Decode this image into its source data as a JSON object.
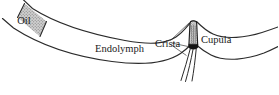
{
  "figure": {
    "background_color": "#ffffff",
    "line_color": "#2b2b2b",
    "oil_fill_color": "#c9c9c9",
    "cupula_fill_color": "#d6d6d6",
    "cupula_base_color": "#1a1a1a",
    "label_color": "#1a1a1a"
  },
  "labels": {
    "oil": "Oil",
    "endolymph": "Endolymph",
    "crista": "Crista",
    "cupula": "Cupula"
  },
  "structures": {
    "tube": "semicircular-canal-tube",
    "oil_plug": "oil-plug-region",
    "ampulla": "ampulla-bulge",
    "cupula_body": "cupula-body",
    "crista_base": "crista-base",
    "nerve_fibers": "nerve-fiber-bundle"
  }
}
